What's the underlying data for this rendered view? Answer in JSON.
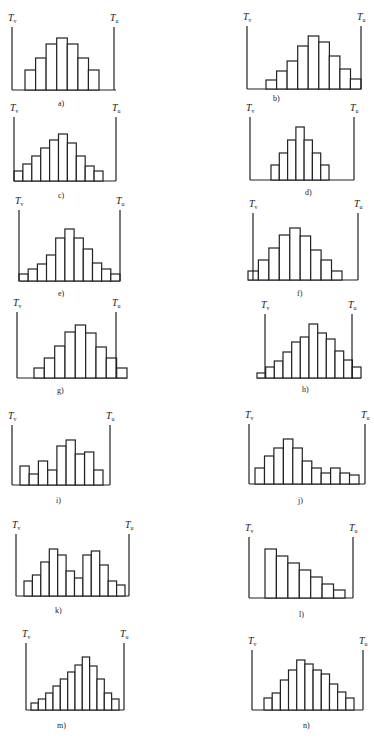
{
  "chart_data": [
    {
      "type": "bar",
      "panel": "a)",
      "values": [
        20,
        32,
        46,
        52,
        46,
        32,
        20
      ],
      "lower_limit": "Tv",
      "upper_limit": "Tu"
    },
    {
      "type": "bar",
      "panel": "b)",
      "values": [
        9,
        18,
        28,
        43,
        53,
        47,
        33,
        20,
        10
      ],
      "lower_limit": "Tv",
      "upper_limit": "Tu"
    },
    {
      "type": "bar",
      "panel": "c)",
      "values": [
        10,
        17,
        25,
        33,
        41,
        47,
        38,
        25,
        15,
        10
      ],
      "lower_limit": "Tv",
      "upper_limit": "Tu"
    },
    {
      "type": "bar",
      "panel": "d)",
      "values": [
        15,
        27,
        40,
        53,
        40,
        27,
        15
      ],
      "lower_limit": "Tv",
      "upper_limit": "Tu"
    },
    {
      "type": "bar",
      "panel": "e)",
      "values": [
        7,
        12,
        17,
        26,
        43,
        52,
        43,
        32,
        18,
        12,
        7
      ],
      "lower_limit": "Tv",
      "upper_limit": "Tu"
    },
    {
      "type": "bar",
      "panel": "f)",
      "values": [
        9,
        20,
        32,
        45,
        52,
        44,
        30,
        20,
        9
      ],
      "lower_limit": "Tv",
      "upper_limit": "Tu"
    },
    {
      "type": "bar",
      "panel": "g)",
      "values": [
        10,
        20,
        32,
        46,
        53,
        45,
        31,
        20,
        10
      ],
      "lower_limit": "Tv",
      "upper_limit": "Tu"
    },
    {
      "type": "bar",
      "panel": "h)",
      "values": [
        5,
        11,
        17,
        26,
        36,
        41,
        54,
        45,
        39,
        27,
        18,
        11
      ],
      "lower_limit": "Tv",
      "upper_limit": "Tu"
    },
    {
      "type": "bar",
      "panel": "i)",
      "values": [
        19,
        11,
        24,
        15,
        39,
        45,
        31,
        33,
        15
      ],
      "lower_limit": "Tv",
      "upper_limit": "Tu"
    },
    {
      "type": "bar",
      "panel": "j)",
      "values": [
        16,
        28,
        36,
        45,
        36,
        23,
        16,
        11,
        16,
        11,
        9
      ],
      "lower_limit": "Tv",
      "upper_limit": "Tu"
    },
    {
      "type": "bar",
      "panel": "k)",
      "values": [
        15,
        21,
        34,
        47,
        41,
        25,
        18,
        41,
        45,
        31,
        15,
        11
      ],
      "lower_limit": "Tv",
      "upper_limit": "Tu"
    },
    {
      "type": "bar",
      "panel": "l)",
      "values": [
        49,
        42,
        35,
        28,
        21,
        14,
        8
      ],
      "lower_limit": "Tv",
      "upper_limit": "Tu"
    },
    {
      "type": "bar",
      "panel": "m)",
      "values": [
        7,
        11,
        17,
        24,
        31,
        38,
        45,
        53,
        44,
        31,
        17,
        11
      ],
      "lower_limit": "Tv",
      "upper_limit": "Tu"
    },
    {
      "type": "bar",
      "panel": "n)",
      "values": [
        12,
        17,
        30,
        40,
        50,
        46,
        40,
        36,
        26,
        18,
        12
      ],
      "lower_limit": "Tv",
      "upper_limit": "Tu"
    }
  ],
  "labels": {
    "tv_main": "T",
    "tv_sub": "v",
    "tu_main": "T",
    "tu_sub": "u"
  }
}
